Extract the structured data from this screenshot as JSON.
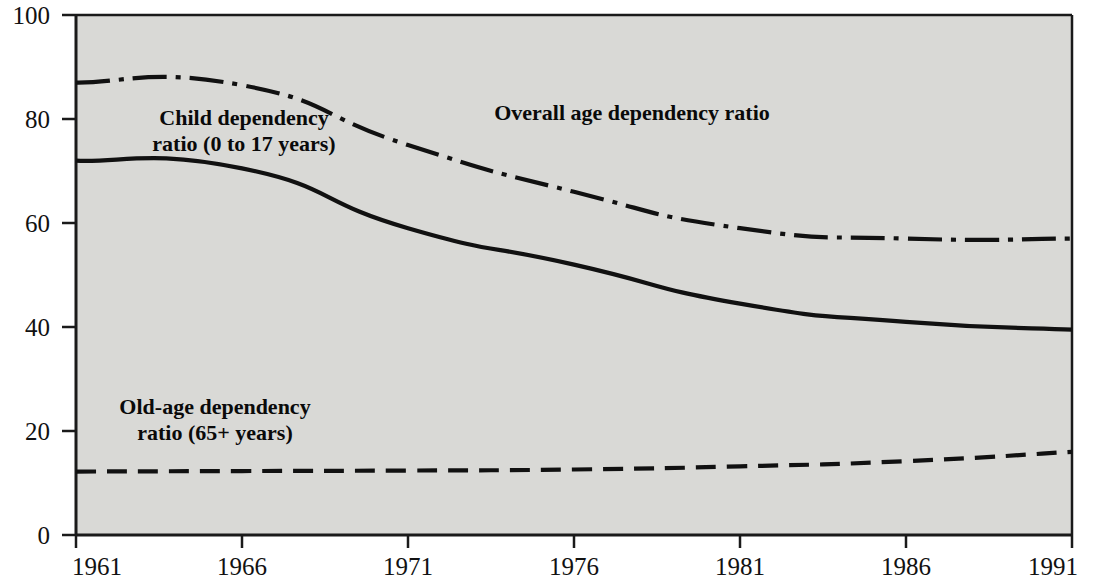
{
  "chart_data": {
    "type": "line",
    "title": "",
    "subtitle": "",
    "xlabel": "",
    "ylabel": "",
    "xlim": [
      1961,
      1991
    ],
    "ylim": [
      0,
      100
    ],
    "grid": false,
    "legend_position": "inline-annotations",
    "background_color": "#d9d9d6",
    "line_color": "#111111",
    "x": [
      1961,
      1966,
      1971,
      1976,
      1981,
      1986,
      1991
    ],
    "xticks": [
      "1961",
      "1966",
      "1971",
      "1976",
      "1981",
      "1986",
      "1991"
    ],
    "yticks": [
      "0",
      "20",
      "40",
      "60",
      "80",
      "100"
    ],
    "ytick_values": [
      0,
      20,
      40,
      60,
      80,
      100
    ],
    "series": [
      {
        "name": "Overall age dependency ratio",
        "style": "dash-dot",
        "values": [
          87,
          86.5,
          75,
          66,
          59,
          57,
          57
        ]
      },
      {
        "name": "Child dependency ratio (0 to 17 years)",
        "style": "solid",
        "values": [
          72,
          70.5,
          59,
          52,
          44.5,
          41,
          39.5
        ]
      },
      {
        "name": "Old-age dependency ratio (65+ years)",
        "style": "dashed",
        "values": [
          12.2,
          12.3,
          12.4,
          12.6,
          13.2,
          14.2,
          16
        ]
      }
    ],
    "annotations": [
      {
        "id": "child-label",
        "lines": [
          "Child dependency",
          "ratio (0 to 17 years)"
        ],
        "x": 244,
        "y": 125
      },
      {
        "id": "overall-label",
        "lines": [
          "Overall age dependency ratio"
        ],
        "x": 632,
        "y": 120
      },
      {
        "id": "oldage-label",
        "lines": [
          "Old-age dependency",
          "ratio (65+ years)"
        ],
        "x": 215,
        "y": 414
      }
    ]
  }
}
